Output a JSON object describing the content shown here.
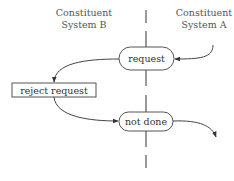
{
  "diagram": {
    "lanes": {
      "left": {
        "line1": "Constituent",
        "line2": "System B"
      },
      "right": {
        "line1": "Constituent",
        "line2": "System A"
      }
    },
    "nodes": {
      "request": {
        "label": "request",
        "shape": "rounded"
      },
      "reject": {
        "label": "reject request",
        "shape": "rectangle"
      },
      "not_done": {
        "label": "not done",
        "shape": "rounded"
      }
    },
    "edges": [
      {
        "from": "System A",
        "to": "request"
      },
      {
        "from": "request",
        "to": "reject request"
      },
      {
        "from": "reject request",
        "to": "not done"
      },
      {
        "from": "not done",
        "to": "out"
      }
    ],
    "colors": {
      "stroke": "#444444",
      "text": "#333333",
      "lane_label": "#555555"
    }
  }
}
